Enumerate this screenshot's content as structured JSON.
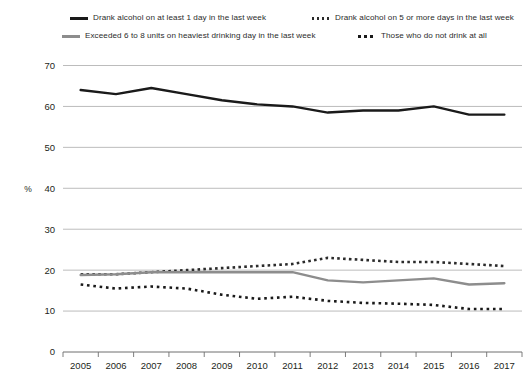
{
  "legend": {
    "items": [
      {
        "label": "Drank alcohol on at least 1 day in the last week",
        "style": "solid-black",
        "color": "#1a1a1a"
      },
      {
        "label": "Drank alcohol on 5 or more days in the last week",
        "style": "dotted-small",
        "color": "#2b2b2b"
      },
      {
        "label": "Exceeded 6 to 8 units on heaviest drinking day in the last week",
        "style": "solid-gray",
        "color": "#8d8d8d"
      },
      {
        "label": "Those who do not drink at all",
        "style": "dotted-large",
        "color": "#1a1a1a"
      }
    ]
  },
  "axes": {
    "y_title": "%",
    "y_ticks": [
      "0",
      "10",
      "20",
      "30",
      "40",
      "50",
      "60",
      "70"
    ],
    "x_ticks": [
      "2005",
      "2006",
      "2007",
      "2008",
      "2009",
      "2010",
      "2011",
      "2012",
      "2013",
      "2014",
      "2015",
      "2016",
      "2017"
    ]
  },
  "chart_data": {
    "type": "line",
    "title": "",
    "subtitle": "",
    "xlabel": "",
    "ylabel": "%",
    "ylim": [
      0,
      70
    ],
    "ytick_step": 10,
    "grid": true,
    "legend_position": "top",
    "categories": [
      "2005",
      "2006",
      "2007",
      "2008",
      "2009",
      "2010",
      "2011",
      "2012",
      "2013",
      "2014",
      "2015",
      "2016",
      "2017"
    ],
    "series": [
      {
        "name": "Drank alcohol on at least 1 day in the last week",
        "style": "solid",
        "color": "#1a1a1a",
        "width": 2.4,
        "values": [
          64,
          63,
          64.5,
          63,
          61.5,
          60.5,
          60,
          58.5,
          59,
          59,
          60,
          58,
          58
        ]
      },
      {
        "name": "Drank alcohol on 5 or more days in the last week",
        "style": "dotted-small",
        "color": "#2b2b2b",
        "width": 2.6,
        "values": [
          19,
          19,
          19.5,
          20,
          20.5,
          21,
          21.5,
          23,
          22.5,
          22,
          22,
          21.5,
          21
        ]
      },
      {
        "name": "Exceeded 6 to 8 units on heaviest drinking day in the last week",
        "style": "solid",
        "color": "#8d8d8d",
        "width": 2.4,
        "values": [
          18.8,
          19,
          19.5,
          19.5,
          19.5,
          19.5,
          19.5,
          17.5,
          17,
          17.5,
          18,
          16.5,
          16.8
        ]
      },
      {
        "name": "Those who do not drink at all",
        "style": "dotted-large",
        "color": "#1a1a1a",
        "width": 2.6,
        "values": [
          16.5,
          15.5,
          16,
          15.5,
          14,
          13,
          13.5,
          12.5,
          12,
          11.8,
          11.5,
          10.5,
          10.5
        ]
      }
    ]
  }
}
